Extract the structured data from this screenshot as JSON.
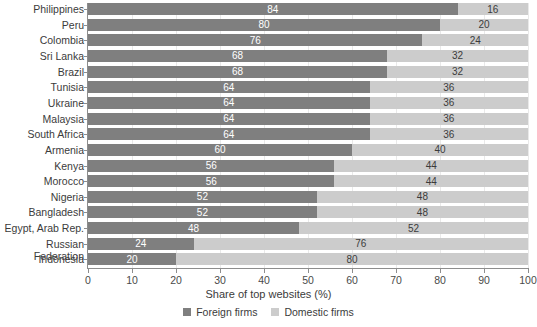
{
  "chart_data": {
    "type": "bar",
    "subtype": "stacked-horizontal-100",
    "title": "",
    "xlabel": "Share of top websites (%)",
    "ylabel": "",
    "xlim": [
      0,
      100
    ],
    "xticks": [
      0,
      10,
      20,
      30,
      40,
      50,
      60,
      70,
      80,
      90,
      100
    ],
    "grid": true,
    "legend_position": "bottom-center",
    "categories": [
      "Philippines",
      "Peru",
      "Colombia",
      "Sri Lanka",
      "Brazil",
      "Tunisia",
      "Ukraine",
      "Malaysia",
      "South Africa",
      "Armenia",
      "Kenya",
      "Morocco",
      "Nigeria",
      "Bangladesh",
      "Egypt, Arab Rep.",
      "Russian Federation",
      "Indonesia"
    ],
    "series": [
      {
        "name": "Foreign firms",
        "color": "#7f7f7f",
        "values": [
          84,
          80,
          76,
          68,
          68,
          64,
          64,
          64,
          64,
          60,
          56,
          56,
          52,
          52,
          48,
          24,
          20
        ]
      },
      {
        "name": "Domestic firms",
        "color": "#cccccc",
        "values": [
          16,
          20,
          24,
          32,
          32,
          36,
          36,
          36,
          36,
          40,
          44,
          44,
          48,
          48,
          52,
          76,
          80
        ]
      }
    ]
  },
  "legend": {
    "items": [
      {
        "label": "Foreign firms",
        "color": "#7f7f7f"
      },
      {
        "label": "Domestic firms",
        "color": "#cccccc"
      }
    ]
  },
  "axis": {
    "x_title": "Share of top websites (%)"
  }
}
